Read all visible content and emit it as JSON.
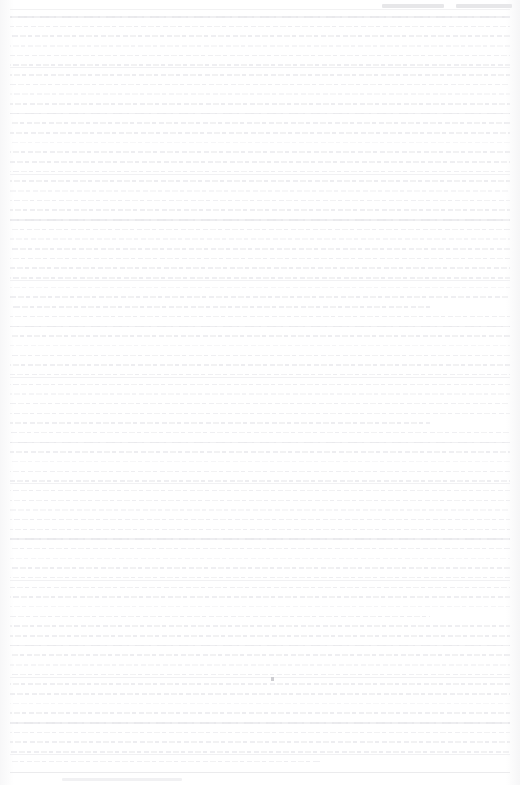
{
  "document": {
    "kind": "scanned-page",
    "legibility": "illegible",
    "page_width": 520,
    "page_height": 785,
    "background_color": "#fefefe",
    "ink_color": "#ededf0",
    "note": ""
  },
  "header": {
    "visible": true,
    "segments": [
      {
        "name": "header-segment-left",
        "text": ""
      },
      {
        "name": "header-segment-right",
        "text": ""
      }
    ],
    "rule_color": "#f2f2f3"
  },
  "body": {
    "line_count": 78,
    "line_height": 9.68,
    "left_margin": 10,
    "right_margin": 10,
    "top_margin": 12,
    "lines": [
      {
        "text": "",
        "style": "strong"
      },
      {
        "text": "",
        "style": "normal"
      },
      {
        "text": "",
        "style": "normal"
      },
      {
        "text": "",
        "style": "faint"
      },
      {
        "text": "",
        "style": "normal"
      },
      {
        "text": "",
        "style": "rule"
      },
      {
        "text": "",
        "style": "normal"
      },
      {
        "text": "",
        "style": "normal"
      },
      {
        "text": "",
        "style": "faint"
      },
      {
        "text": "",
        "style": "normal"
      },
      {
        "text": "",
        "style": "strong"
      },
      {
        "text": "",
        "style": "normal"
      },
      {
        "text": "",
        "style": "normal"
      },
      {
        "text": "",
        "style": "faint"
      },
      {
        "text": "",
        "style": "normal"
      },
      {
        "text": "",
        "style": "normal"
      },
      {
        "text": "",
        "style": "rule"
      },
      {
        "text": "",
        "style": "normal"
      },
      {
        "text": "",
        "style": "faint"
      },
      {
        "text": "",
        "style": "normal"
      },
      {
        "text": "",
        "style": "normal"
      },
      {
        "text": "",
        "style": "strong"
      },
      {
        "text": "",
        "style": "normal"
      },
      {
        "text": "",
        "style": "faint"
      },
      {
        "text": "",
        "style": "normal"
      },
      {
        "text": "",
        "style": "normal"
      },
      {
        "text": "",
        "style": "normal"
      },
      {
        "text": "",
        "style": "rule"
      },
      {
        "text": "",
        "style": "faint"
      },
      {
        "text": "",
        "style": "normal"
      },
      {
        "text": "",
        "style": "medium"
      },
      {
        "text": "",
        "style": "normal"
      },
      {
        "text": "",
        "style": "strong"
      },
      {
        "text": "",
        "style": "normal"
      },
      {
        "text": "",
        "style": "faint"
      },
      {
        "text": "",
        "style": "normal"
      },
      {
        "text": "",
        "style": "normal"
      },
      {
        "text": "",
        "style": "rule"
      },
      {
        "text": "",
        "style": "normal"
      },
      {
        "text": "",
        "style": "faint"
      },
      {
        "text": "",
        "style": "normal"
      },
      {
        "text": "",
        "style": "normal"
      },
      {
        "text": "",
        "style": "medium"
      },
      {
        "text": "",
        "style": "normal"
      },
      {
        "text": "",
        "style": "strong"
      },
      {
        "text": "",
        "style": "normal"
      },
      {
        "text": "",
        "style": "faint"
      },
      {
        "text": "",
        "style": "normal"
      },
      {
        "text": "",
        "style": "rule"
      },
      {
        "text": "",
        "style": "normal"
      },
      {
        "text": "",
        "style": "normal"
      },
      {
        "text": "",
        "style": "faint"
      },
      {
        "text": "",
        "style": "normal"
      },
      {
        "text": "",
        "style": "normal"
      },
      {
        "text": "",
        "style": "strong"
      },
      {
        "text": "",
        "style": "normal"
      },
      {
        "text": "",
        "style": "faint"
      },
      {
        "text": "",
        "style": "normal"
      },
      {
        "text": "",
        "style": "rule"
      },
      {
        "text": "",
        "style": "normal"
      },
      {
        "text": "",
        "style": "normal"
      },
      {
        "text": "",
        "style": "faint"
      },
      {
        "text": "",
        "style": "medium"
      },
      {
        "text": "",
        "style": "normal"
      },
      {
        "text": "",
        "style": "normal"
      },
      {
        "text": "",
        "style": "strong"
      },
      {
        "text": "",
        "style": "normal"
      },
      {
        "text": "",
        "style": "faint"
      },
      {
        "text": "",
        "style": "rule"
      },
      {
        "text": "",
        "style": "normal"
      },
      {
        "text": "",
        "style": "normal"
      },
      {
        "text": "",
        "style": "faint"
      },
      {
        "text": "",
        "style": "normal"
      },
      {
        "text": "",
        "style": "strong"
      },
      {
        "text": "",
        "style": "normal"
      },
      {
        "text": "",
        "style": "normal"
      },
      {
        "text": "",
        "style": "rule"
      },
      {
        "text": "",
        "style": "short"
      }
    ]
  },
  "marks": {
    "ink_speck": {
      "visible": true,
      "x": 271,
      "y": 677
    }
  },
  "footer": {
    "visible": true,
    "text": "",
    "rule_color": "#ebebed"
  }
}
